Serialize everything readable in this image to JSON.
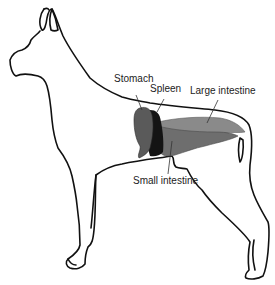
{
  "diagram": {
    "labels": {
      "stomach": "Stomach",
      "spleen": "Spleen",
      "large_intestine": "Large intestine",
      "small_intestine": "Small intestine"
    },
    "colors": {
      "outline": "#111111",
      "stomach": "#5a5a5a",
      "spleen": "#141414",
      "large_intestine": "#8a8a8a",
      "small_intestine": "#6e6e6e",
      "background": "#ffffff"
    }
  }
}
